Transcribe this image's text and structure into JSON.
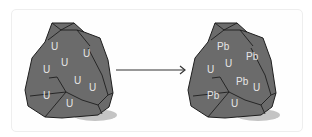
{
  "diagram": {
    "before": {
      "labels": [
        {
          "text": "U",
          "x": 55,
          "y": 50
        },
        {
          "text": "U",
          "x": 85,
          "y": 57
        },
        {
          "text": "U",
          "x": 45,
          "y": 73
        },
        {
          "text": "U",
          "x": 64,
          "y": 66
        },
        {
          "text": "U",
          "x": 75,
          "y": 84
        },
        {
          "text": "U",
          "x": 92,
          "y": 91
        },
        {
          "text": "U",
          "x": 45,
          "y": 99
        },
        {
          "text": "U",
          "x": 68,
          "y": 107
        }
      ]
    },
    "arrow": {
      "direction": "right"
    },
    "after": {
      "labels": [
        {
          "text": "Pb",
          "x": 219,
          "y": 50
        },
        {
          "text": "Pb",
          "x": 248,
          "y": 60
        },
        {
          "text": "U",
          "x": 209,
          "y": 73
        },
        {
          "text": "U",
          "x": 227,
          "y": 67
        },
        {
          "text": "Pb",
          "x": 238,
          "y": 85
        },
        {
          "text": "U",
          "x": 255,
          "y": 91
        },
        {
          "text": "Pb",
          "x": 209,
          "y": 99
        },
        {
          "text": "U",
          "x": 233,
          "y": 107
        }
      ]
    },
    "colors": {
      "rock": "#6b6b6b",
      "crack": "#1e1e1e",
      "label": "#e6e6e6",
      "shadow": "#bdbdbd",
      "arrow": "#333333"
    }
  }
}
